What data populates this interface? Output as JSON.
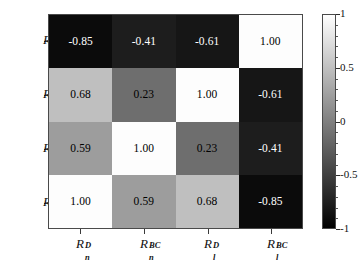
{
  "chart_data": {
    "type": "heatmap",
    "title": "",
    "xlabel": "",
    "ylabel": "",
    "grid": false,
    "colormap": "gray",
    "colorbar": {
      "position": "right",
      "vmin": -1,
      "vmax": 1,
      "ticks": [
        "1",
        "0.5",
        "0",
        "-0.5",
        "-1"
      ],
      "tick_values": [
        1,
        0.5,
        0,
        -0.5,
        -1
      ]
    },
    "x_categories": [
      "R_n^D",
      "R_n^BC",
      "R_l^D",
      "R_l^BC"
    ],
    "y_categories": [
      "R_l^BC",
      "R_l^D",
      "R_n^BC",
      "R_n^D"
    ],
    "x_tick_labels": [
      {
        "base": "R",
        "sub": "n",
        "sup": "D"
      },
      {
        "base": "R",
        "sub": "n",
        "sup": "BC"
      },
      {
        "base": "R",
        "sub": "l",
        "sup": "D"
      },
      {
        "base": "R",
        "sub": "l",
        "sup": "BC"
      }
    ],
    "y_tick_labels": [
      {
        "base": "R",
        "sub": "l",
        "sup": "BC"
      },
      {
        "base": "R",
        "sub": "l",
        "sup": "D"
      },
      {
        "base": "R",
        "sub": "n",
        "sup": "BC"
      },
      {
        "base": "R",
        "sub": "n",
        "sup": "D"
      }
    ],
    "rows": [
      {
        "label": "R_l^BC",
        "values": [
          -0.85,
          -0.41,
          -0.61,
          1.0
        ]
      },
      {
        "label": "R_l^D",
        "values": [
          0.68,
          0.23,
          1.0,
          -0.61
        ]
      },
      {
        "label": "R_n^BC",
        "values": [
          0.59,
          1.0,
          0.23,
          -0.41
        ]
      },
      {
        "label": "R_n^D",
        "values": [
          1.0,
          0.59,
          0.68,
          -0.85
        ]
      }
    ],
    "cells": [
      {
        "row": 0,
        "col": 0,
        "value": -0.85,
        "text": "-0.85",
        "fill": "#0b0b0b",
        "text_color": "#ffffff"
      },
      {
        "row": 0,
        "col": 1,
        "value": -0.41,
        "text": "-0.41",
        "fill": "#1d1d1d",
        "text_color": "#ffffff"
      },
      {
        "row": 0,
        "col": 2,
        "value": -0.61,
        "text": "-0.61",
        "fill": "#161616",
        "text_color": "#ffffff"
      },
      {
        "row": 0,
        "col": 3,
        "value": 1.0,
        "text": "1.00",
        "fill": "#fdfdfd",
        "text_color": "#000000"
      },
      {
        "row": 1,
        "col": 0,
        "value": 0.68,
        "text": "0.68",
        "fill": "#bfbfbf",
        "text_color": "#000000"
      },
      {
        "row": 1,
        "col": 1,
        "value": 0.23,
        "text": "0.23",
        "fill": "#6e6e6e",
        "text_color": "#000000"
      },
      {
        "row": 1,
        "col": 2,
        "value": 1.0,
        "text": "1.00",
        "fill": "#fdfdfd",
        "text_color": "#000000"
      },
      {
        "row": 1,
        "col": 3,
        "value": -0.61,
        "text": "-0.61",
        "fill": "#161616",
        "text_color": "#ffffff"
      },
      {
        "row": 2,
        "col": 0,
        "value": 0.59,
        "text": "0.59",
        "fill": "#9d9d9d",
        "text_color": "#000000"
      },
      {
        "row": 2,
        "col": 1,
        "value": 1.0,
        "text": "1.00",
        "fill": "#fdfdfd",
        "text_color": "#000000"
      },
      {
        "row": 2,
        "col": 2,
        "value": 0.23,
        "text": "0.23",
        "fill": "#6e6e6e",
        "text_color": "#000000"
      },
      {
        "row": 2,
        "col": 3,
        "value": -0.41,
        "text": "-0.41",
        "fill": "#1d1d1d",
        "text_color": "#ffffff"
      },
      {
        "row": 3,
        "col": 0,
        "value": 1.0,
        "text": "1.00",
        "fill": "#fdfdfd",
        "text_color": "#000000"
      },
      {
        "row": 3,
        "col": 1,
        "value": 0.59,
        "text": "0.59",
        "fill": "#9d9d9d",
        "text_color": "#000000"
      },
      {
        "row": 3,
        "col": 2,
        "value": 0.68,
        "text": "0.68",
        "fill": "#bfbfbf",
        "text_color": "#000000"
      },
      {
        "row": 3,
        "col": 3,
        "value": -0.85,
        "text": "-0.85",
        "fill": "#0b0b0b",
        "text_color": "#ffffff"
      }
    ]
  }
}
